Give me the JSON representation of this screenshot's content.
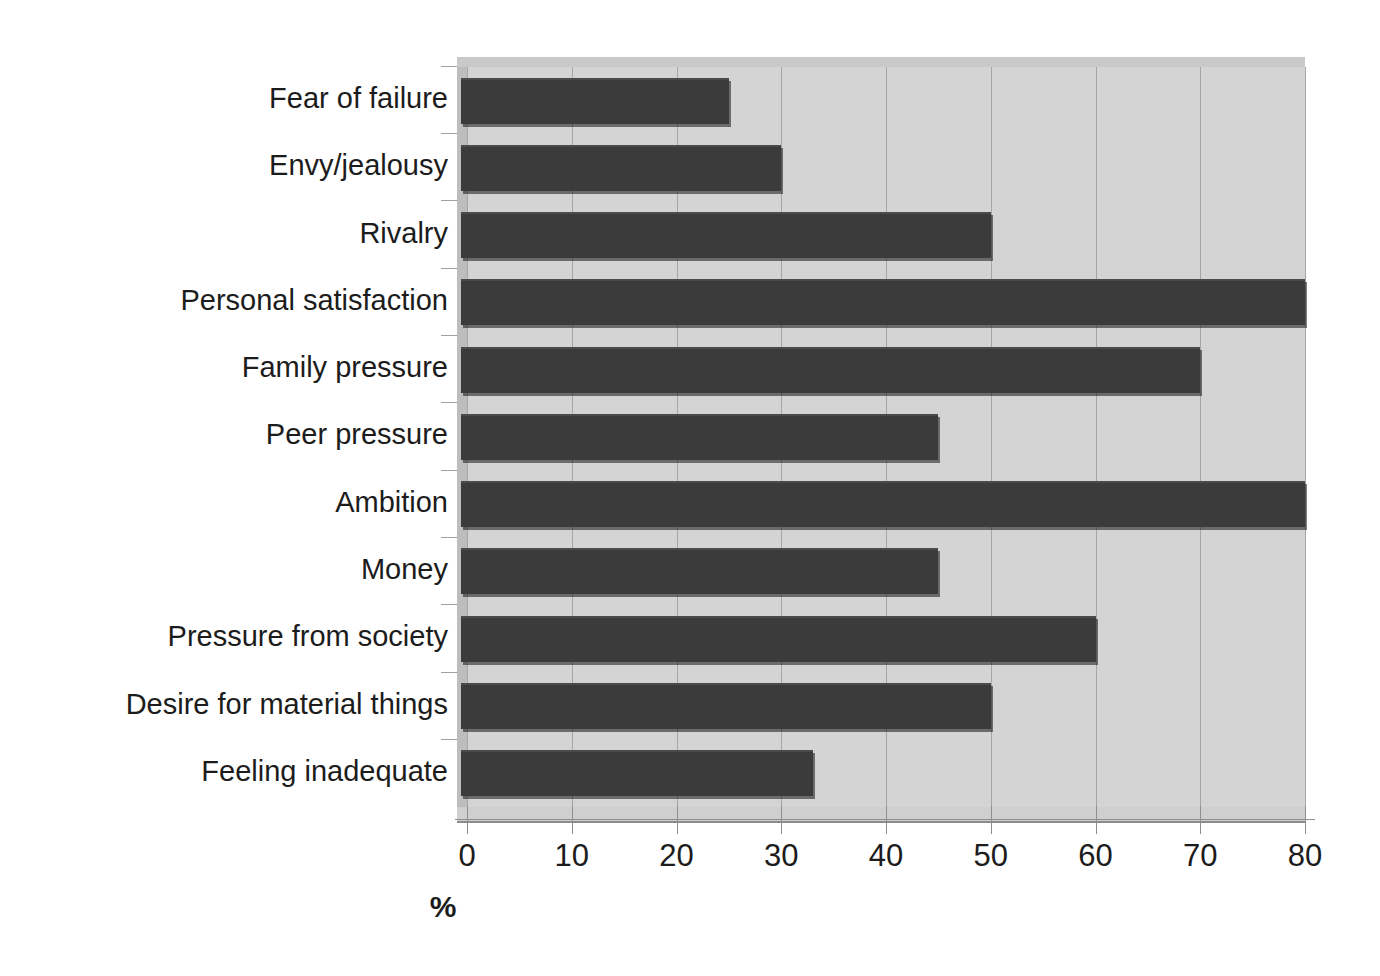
{
  "chart_data": {
    "type": "bar",
    "orientation": "horizontal",
    "title": "",
    "xlabel": "%",
    "ylabel": "",
    "xlim": [
      0,
      80
    ],
    "xticks": [
      0,
      10,
      20,
      30,
      40,
      50,
      60,
      70,
      80
    ],
    "xtick_labels": [
      "0",
      "10",
      "20",
      "30",
      "40",
      "50",
      "60",
      "70",
      "80"
    ],
    "grid": true,
    "legend": false,
    "categories": [
      "Fear of failure",
      "Envy/jealousy",
      "Rivalry",
      "Personal satisfaction",
      "Family pressure",
      "Peer pressure",
      "Ambition",
      "Money",
      "Pressure from society",
      "Desire for material things",
      "Feeling inadequate"
    ],
    "values": [
      25,
      30,
      50,
      80,
      70,
      45,
      80,
      45,
      60,
      50,
      33
    ],
    "bar_color": "#3b3b3b",
    "plot_background": "#d4d4d4"
  },
  "axis": {
    "x_title": "%"
  }
}
